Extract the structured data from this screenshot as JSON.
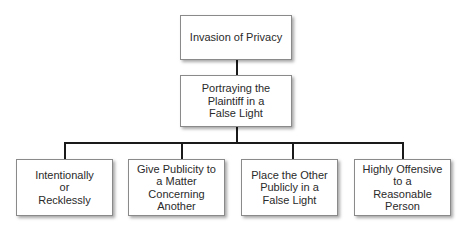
{
  "diagram": {
    "root": {
      "label": "Invasion of Privacy"
    },
    "tort": {
      "label": "Portraying the\nPlaintiff in a\nFalse Light"
    },
    "elements": [
      {
        "label": "Intentionally\nor\nRecklessly"
      },
      {
        "label": "Give Publicity to\na Matter\nConcerning Another"
      },
      {
        "label": "Place the Other\nPublicly in a\nFalse Light"
      },
      {
        "label": "Highly Offensive\nto a\nReasonable Person"
      }
    ],
    "colors": {
      "border": "#8a8a8a",
      "connector": "#1a1a1a",
      "text": "#2a2a2a",
      "background": "#ffffff"
    }
  }
}
